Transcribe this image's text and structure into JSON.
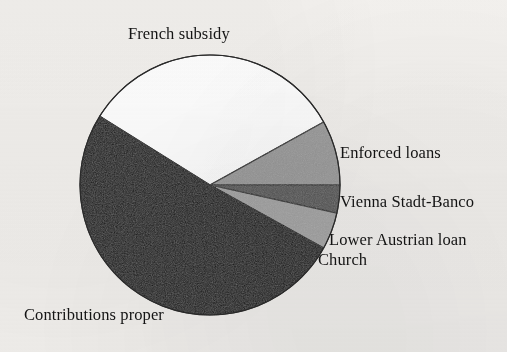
{
  "chart_data": {
    "type": "pie",
    "title": "",
    "subtitle": "",
    "xlabel": "",
    "ylabel": "",
    "legend_position": "labels-around-pie",
    "grid": false,
    "categories": [
      "French subsidy",
      "Enforced loans",
      "Vienna Stadt-Banco",
      "Lower Austrian loan",
      "Church",
      "Contributions proper"
    ],
    "values": [
      33,
      8,
      3.5,
      5,
      0.5,
      50
    ],
    "value_unit": "percent",
    "slices": [
      {
        "label": "French subsidy",
        "value": 33,
        "start_angle": -148,
        "end_angle": -29,
        "sweep": 119,
        "fill": "#ffffff",
        "stroke": "#2b2b2b",
        "label_x": 128,
        "label_y": 24
      },
      {
        "label": "Enforced loans",
        "value": 8,
        "start_angle": -29,
        "end_angle": 0,
        "sweep": 29,
        "fill": "#9b9b9b",
        "stroke": "#2b2b2b",
        "label_x": 340,
        "label_y": 143
      },
      {
        "label": "Vienna Stadt-Banco",
        "value": 3.5,
        "start_angle": 0,
        "end_angle": 12.5,
        "sweep": 12.5,
        "fill": "#565656",
        "stroke": "#2b2b2b",
        "label_x": 340,
        "label_y": 192
      },
      {
        "label": "Lower Austrian loan",
        "value": 5,
        "start_angle": 12.5,
        "end_angle": 29,
        "sweep": 16.5,
        "fill": "#a6a6a6",
        "stroke": "#2b2b2b",
        "label_x": 329,
        "label_y": 230
      },
      {
        "label": "Church",
        "value": 0.5,
        "start_angle": 29,
        "end_angle": 31,
        "sweep": 2,
        "fill": "#141414",
        "stroke": "#141414",
        "label_x": 318,
        "label_y": 250
      },
      {
        "label": "Contributions proper",
        "value": 50,
        "start_angle": 31,
        "end_angle": 212,
        "sweep": 181,
        "fill": "#141414",
        "stroke": "#141414",
        "label_x": 24,
        "label_y": 305
      }
    ],
    "geometry": {
      "center_x": 210,
      "center_y": 185,
      "radius": 130
    },
    "colors": {
      "background": "#f3f1ee",
      "outline": "#2b2b2b",
      "text": "#141414",
      "white_slice": "#ffffff",
      "light_gray_slice": "#9b9b9b",
      "dark_gray_slice": "#565656",
      "black_slice": "#141414"
    }
  },
  "labels": {
    "french_subsidy": "French subsidy",
    "enforced_loans": "Enforced loans",
    "vienna_stadt_banco": "Vienna Stadt-Banco",
    "lower_austrian_loan": "Lower Austrian loan",
    "church": "Church",
    "contributions_proper": "Contributions proper"
  }
}
